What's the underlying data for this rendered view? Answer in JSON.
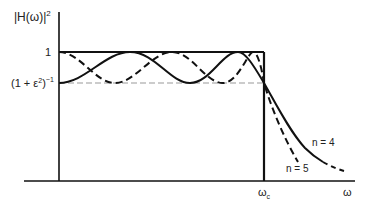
{
  "diagram": {
    "y_axis_label": "|H(ω)|",
    "y_axis_label_exp": "2",
    "y_tick_top": "1",
    "y_tick_bottom_base": "(1 + ε",
    "y_tick_bottom_sq": "2",
    "y_tick_bottom_close": ")",
    "y_tick_bottom_exp": "−1",
    "x_axis_label": "ω",
    "x_cutoff_label": "ω",
    "x_cutoff_sub": "c",
    "curves": [
      {
        "name": "n = 4",
        "style": "solid"
      },
      {
        "name": "n = 5",
        "style": "dashed"
      }
    ],
    "colors": {
      "line": "#111111",
      "guide": "#999999"
    }
  }
}
